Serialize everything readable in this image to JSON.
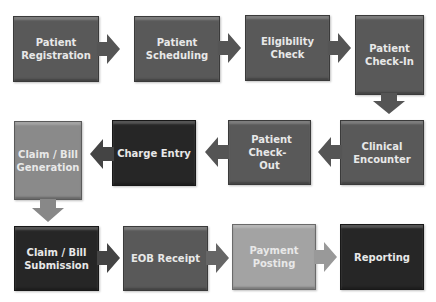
{
  "diagram": {
    "type": "process-flow",
    "title": "",
    "steps": [
      {
        "id": 1,
        "label": "Patient Registration",
        "line1": "Patient",
        "line2": "Registration",
        "color": "#595959"
      },
      {
        "id": 2,
        "label": "Patient Scheduling",
        "line1": "Patient",
        "line2": "Scheduling",
        "color": "#595959"
      },
      {
        "id": 3,
        "label": "Eligibility Check",
        "line1": "Eligibility",
        "line2": "Check",
        "color": "#595959"
      },
      {
        "id": 4,
        "label": "Patient Check-In",
        "line1": "Patient",
        "line2": "Check-In",
        "color": "#595959"
      },
      {
        "id": 5,
        "label": "Clinical Encounter",
        "line1": "Clinical",
        "line2": "Encounter",
        "color": "#595959"
      },
      {
        "id": 6,
        "label": "Patient Check-Out",
        "line1": "Patient Check-",
        "line2": "Out",
        "color": "#595959"
      },
      {
        "id": 7,
        "label": "Charge Entry",
        "line1": "Charge Entry",
        "line2": "",
        "color": "#262626"
      },
      {
        "id": 8,
        "label": "Claim / Bill Generation",
        "line1": "Claim / Bill",
        "line2": "Generation",
        "color": "#8a8a8a"
      },
      {
        "id": 9,
        "label": "Claim / Bill Submission",
        "line1": "Claim / Bill",
        "line2": "Submission",
        "color": "#262626"
      },
      {
        "id": 10,
        "label": "EOB Receipt",
        "line1": "EOB Receipt",
        "line2": "",
        "color": "#595959"
      },
      {
        "id": 11,
        "label": "Payment Posting",
        "line1": "Payment",
        "line2": "Posting",
        "color": "#a3a3a3"
      },
      {
        "id": 12,
        "label": "Reporting",
        "line1": "Reporting",
        "line2": "",
        "color": "#262626"
      }
    ],
    "edges": [
      {
        "from": 1,
        "to": 2,
        "direction": "right"
      },
      {
        "from": 2,
        "to": 3,
        "direction": "right"
      },
      {
        "from": 3,
        "to": 4,
        "direction": "right"
      },
      {
        "from": 4,
        "to": 5,
        "direction": "down"
      },
      {
        "from": 5,
        "to": 6,
        "direction": "left"
      },
      {
        "from": 6,
        "to": 7,
        "direction": "left"
      },
      {
        "from": 7,
        "to": 8,
        "direction": "left"
      },
      {
        "from": 8,
        "to": 9,
        "direction": "down"
      },
      {
        "from": 9,
        "to": 10,
        "direction": "right"
      },
      {
        "from": 10,
        "to": 11,
        "direction": "right"
      },
      {
        "from": 11,
        "to": 12,
        "direction": "right"
      }
    ]
  }
}
